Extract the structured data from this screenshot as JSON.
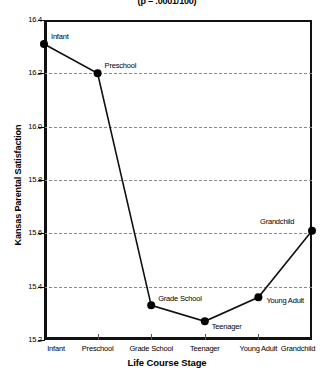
{
  "chart_data": {
    "type": "line",
    "title": "(p = .0001/100)",
    "xlabel": "Life Course Stage",
    "ylabel": "Kansas Parental Satisfaction",
    "categories": [
      "Infant",
      "Preschool",
      "Grade School",
      "Teenager",
      "Young Adult",
      "Grandchild"
    ],
    "values": [
      16.31,
      16.2,
      15.33,
      15.27,
      15.36,
      15.61
    ],
    "point_labels": [
      "Infant",
      "Preschool",
      "Grade School",
      "Teenager",
      "Young Adult",
      "Grandchild"
    ],
    "ylim": [
      15.2,
      16.4
    ],
    "yticks": [
      "16.4",
      "16.2",
      "16.0",
      "15.8",
      "15.6",
      "15.4",
      "15.2"
    ],
    "ytick_values": [
      16.4,
      16.2,
      16.0,
      15.8,
      15.6,
      15.4,
      15.2
    ],
    "grid": true,
    "grid_axis": "y",
    "legend": false,
    "legend_position": "none",
    "marker": "filled-circle",
    "line_color": "#111111",
    "marker_color": "#000000",
    "grid_color": "#8a8a8a",
    "background": "#ffffff"
  }
}
